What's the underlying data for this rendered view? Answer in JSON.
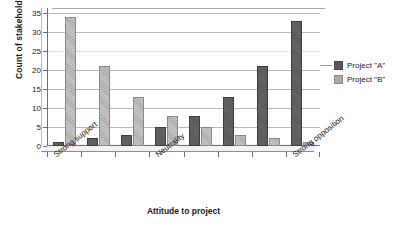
{
  "chart_data": {
    "type": "bar",
    "title": "",
    "xlabel": "Attitude to project",
    "ylabel": "Count of stakeholders",
    "ylim": [
      0,
      35
    ],
    "yticks": [
      0,
      5,
      10,
      15,
      20,
      25,
      30,
      35
    ],
    "grid": true,
    "legend_position": "right",
    "categories": [
      "Strong support",
      "",
      "",
      "Neutrality",
      "",
      "",
      "",
      "Strong opposition"
    ],
    "visible_category_labels": [
      {
        "index": 0,
        "label": "Strong support"
      },
      {
        "index": 3,
        "label": "Neutrality"
      },
      {
        "index": 7,
        "label": "Strong opposition"
      }
    ],
    "series": [
      {
        "name": "Project \"A\"",
        "color": "#595959",
        "values": [
          1,
          2,
          3,
          5,
          8,
          13,
          21,
          33
        ]
      },
      {
        "name": "Project \"B\"",
        "color": "#ababab",
        "values": [
          34,
          21,
          13,
          8,
          5,
          3,
          2,
          1
        ]
      }
    ]
  },
  "legend": {
    "items": [
      {
        "label": "Project \"A\""
      },
      {
        "label": "Project \"B\""
      }
    ]
  }
}
